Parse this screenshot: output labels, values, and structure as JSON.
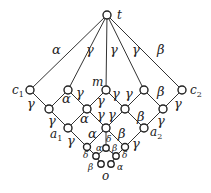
{
  "nodes": [
    {
      "id": "t",
      "x": 107,
      "y": 15,
      "r": 4,
      "label": "t",
      "lx": 117,
      "ly": 19
    },
    {
      "id": "c1",
      "x": 30,
      "y": 90,
      "r": 4,
      "label": "c1",
      "lx": 12,
      "ly": 94
    },
    {
      "id": "u2",
      "x": 68,
      "y": 90,
      "r": 4
    },
    {
      "id": "m",
      "x": 106,
      "y": 90,
      "r": 4,
      "label": "m",
      "lx": 92,
      "ly": 86
    },
    {
      "id": "u4",
      "x": 144,
      "y": 90,
      "r": 4
    },
    {
      "id": "c2",
      "x": 182,
      "y": 90,
      "r": 4,
      "label": "c2",
      "lx": 190,
      "ly": 94
    },
    {
      "id": "r1",
      "x": 49,
      "y": 109,
      "r": 4
    },
    {
      "id": "r2",
      "x": 87,
      "y": 109,
      "r": 4
    },
    {
      "id": "r3",
      "x": 125,
      "y": 109,
      "r": 4
    },
    {
      "id": "r4",
      "x": 163,
      "y": 109,
      "r": 4
    },
    {
      "id": "a1",
      "x": 68,
      "y": 128,
      "r": 4,
      "label": "a1",
      "lx": 50,
      "ly": 138
    },
    {
      "id": "q",
      "x": 106,
      "y": 128,
      "r": 4
    },
    {
      "id": "a2",
      "x": 144,
      "y": 128,
      "r": 4,
      "label": "a2",
      "lx": 150,
      "ly": 136
    },
    {
      "id": "s1",
      "x": 87,
      "y": 147,
      "r": 3.5
    },
    {
      "id": "s2",
      "x": 106,
      "y": 148,
      "r": 3.2
    },
    {
      "id": "s3",
      "x": 125,
      "y": 147,
      "r": 3.5
    },
    {
      "id": "p1",
      "x": 96,
      "y": 156,
      "r": 3.2
    },
    {
      "id": "p2",
      "x": 116,
      "y": 156,
      "r": 3.2
    },
    {
      "id": "b1",
      "x": 101,
      "y": 164,
      "r": 3.2
    },
    {
      "id": "b2",
      "x": 111,
      "y": 164,
      "r": 3.2
    },
    {
      "id": "o",
      "x": 106,
      "y": 164,
      "r": 0,
      "label": "o",
      "lx": 102,
      "ly": 180
    }
  ],
  "edges": [
    {
      "from": "t",
      "to": "c1",
      "label": "α",
      "lx": 52,
      "ly": 54
    },
    {
      "from": "t",
      "to": "u2",
      "label": "γ",
      "lx": 86,
      "ly": 54
    },
    {
      "from": "t",
      "to": "m",
      "label": "γ",
      "lx": 110,
      "ly": 54
    },
    {
      "from": "t",
      "to": "u4",
      "label": "γ",
      "lx": 132,
      "ly": 54
    },
    {
      "from": "t",
      "to": "c2",
      "label": "β",
      "lx": 157,
      "ly": 54
    },
    {
      "from": "c1",
      "to": "r1",
      "label": "γ",
      "lx": 27,
      "ly": 108
    },
    {
      "from": "u2",
      "to": "r1",
      "label": "α",
      "lx": 62,
      "ly": 103
    },
    {
      "from": "u2",
      "to": "r2",
      "label": "γ",
      "lx": 76,
      "ly": 97
    },
    {
      "from": "m",
      "to": "r2",
      "label": "γ",
      "lx": 97,
      "ly": 105
    },
    {
      "from": "m",
      "to": "r3",
      "label": "γ",
      "lx": 112,
      "ly": 98
    },
    {
      "from": "u4",
      "to": "r3",
      "label": "γ",
      "lx": 125,
      "ly": 98
    },
    {
      "from": "u4",
      "to": "r4",
      "label": "β",
      "lx": 157,
      "ly": 96
    },
    {
      "from": "c2",
      "to": "r4",
      "label": "γ",
      "lx": 174,
      "ly": 108
    },
    {
      "from": "r1",
      "to": "a1",
      "label": "γ",
      "lx": 48,
      "ly": 125
    },
    {
      "from": "r2",
      "to": "a1",
      "label": "α",
      "lx": 80,
      "ly": 123
    },
    {
      "from": "r2",
      "to": "q",
      "label": "γ",
      "lx": 97,
      "ly": 119
    },
    {
      "from": "r3",
      "to": "q",
      "label": "γ",
      "lx": 108,
      "ly": 119
    },
    {
      "from": "r3",
      "to": "a2",
      "label": "β",
      "lx": 137,
      "ly": 121
    },
    {
      "from": "r4",
      "to": "a2",
      "label": "γ",
      "lx": 157,
      "ly": 125
    },
    {
      "from": "a1",
      "to": "s1",
      "label": "γ",
      "lx": 67,
      "ly": 145
    },
    {
      "from": "q",
      "to": "s1",
      "label": "α",
      "lx": 88,
      "ly": 138
    },
    {
      "from": "q",
      "to": "s2",
      "label": "δ",
      "lx": 106,
      "ly": 142
    },
    {
      "from": "q",
      "to": "s3",
      "label": "β",
      "lx": 118,
      "ly": 138
    },
    {
      "from": "a2",
      "to": "s3",
      "label": "γ",
      "lx": 132,
      "ly": 148
    },
    {
      "from": "s1",
      "to": "p1",
      "label": "δ",
      "lx": 83,
      "ly": 158
    },
    {
      "from": "s2",
      "to": "p1",
      "label": "α",
      "lx": 96,
      "ly": 151
    },
    {
      "from": "s2",
      "to": "p2",
      "label": "β",
      "lx": 112,
      "ly": 151
    },
    {
      "from": "s3",
      "to": "p2",
      "label": "δ",
      "lx": 122,
      "ly": 158
    },
    {
      "from": "p1",
      "to": "b1",
      "label": "β",
      "lx": 88,
      "ly": 170
    },
    {
      "from": "p2",
      "to": "b2",
      "label": "α",
      "lx": 117,
      "ly": 170
    }
  ]
}
